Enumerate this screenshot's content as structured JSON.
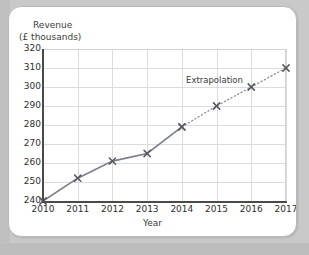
{
  "chart_data": {
    "type": "line",
    "title": "",
    "xlabel": "Year",
    "ylabel": "Revenue (£ thousands)",
    "ylabel_line1": "Revenue",
    "ylabel_line2": "(£ thousands)",
    "x": [
      2010,
      2011,
      2012,
      2013,
      2014,
      2015,
      2016,
      2017
    ],
    "xtick_labels": [
      "2010",
      "2011",
      "2012",
      "2013",
      "2014",
      "2015",
      "2016",
      "2017"
    ],
    "ytick_labels": [
      "240",
      "250",
      "260",
      "270",
      "280",
      "290",
      "300",
      "310",
      "320"
    ],
    "ytick_values": [
      240,
      250,
      260,
      270,
      280,
      290,
      300,
      310,
      320
    ],
    "xlim": [
      2010,
      2017
    ],
    "ylim": [
      240,
      320
    ],
    "grid": true,
    "legend": "none",
    "marker": "x-cross",
    "series": [
      {
        "name": "Revenue (actual)",
        "style": "solid",
        "color": "#7b7f8c",
        "x": [
          2010,
          2011,
          2012,
          2013,
          2014
        ],
        "values": [
          240,
          252,
          261,
          265,
          279
        ]
      },
      {
        "name": "Extrapolation",
        "style": "dotted",
        "color": "#8b8f9a",
        "x": [
          2014,
          2015,
          2016,
          2017
        ],
        "values": [
          279,
          290,
          300,
          310
        ]
      }
    ],
    "annotations": [
      {
        "text": "Extrapolation",
        "x": 2015.1,
        "y": 303
      }
    ]
  }
}
